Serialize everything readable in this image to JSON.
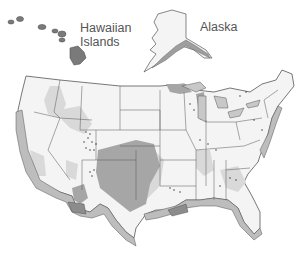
{
  "map": {
    "labels": {
      "hawaii_line1": "Hawaiian",
      "hawaii_line2": "Islands",
      "alaska": "Alaska"
    },
    "colors": {
      "background": "#ffffff",
      "land": "#f4f4f4",
      "light_zone": "#d9d9d9",
      "dark_zone": "#a6a6a6",
      "coast_band_light": "#bdbdbd",
      "coast_band_dark": "#8c8c8c",
      "water": "#c8c8c8",
      "border": "#555555",
      "label": "#555555"
    },
    "regions": [
      "Hawaiian Islands",
      "Alaska",
      "Contiguous United States"
    ]
  }
}
